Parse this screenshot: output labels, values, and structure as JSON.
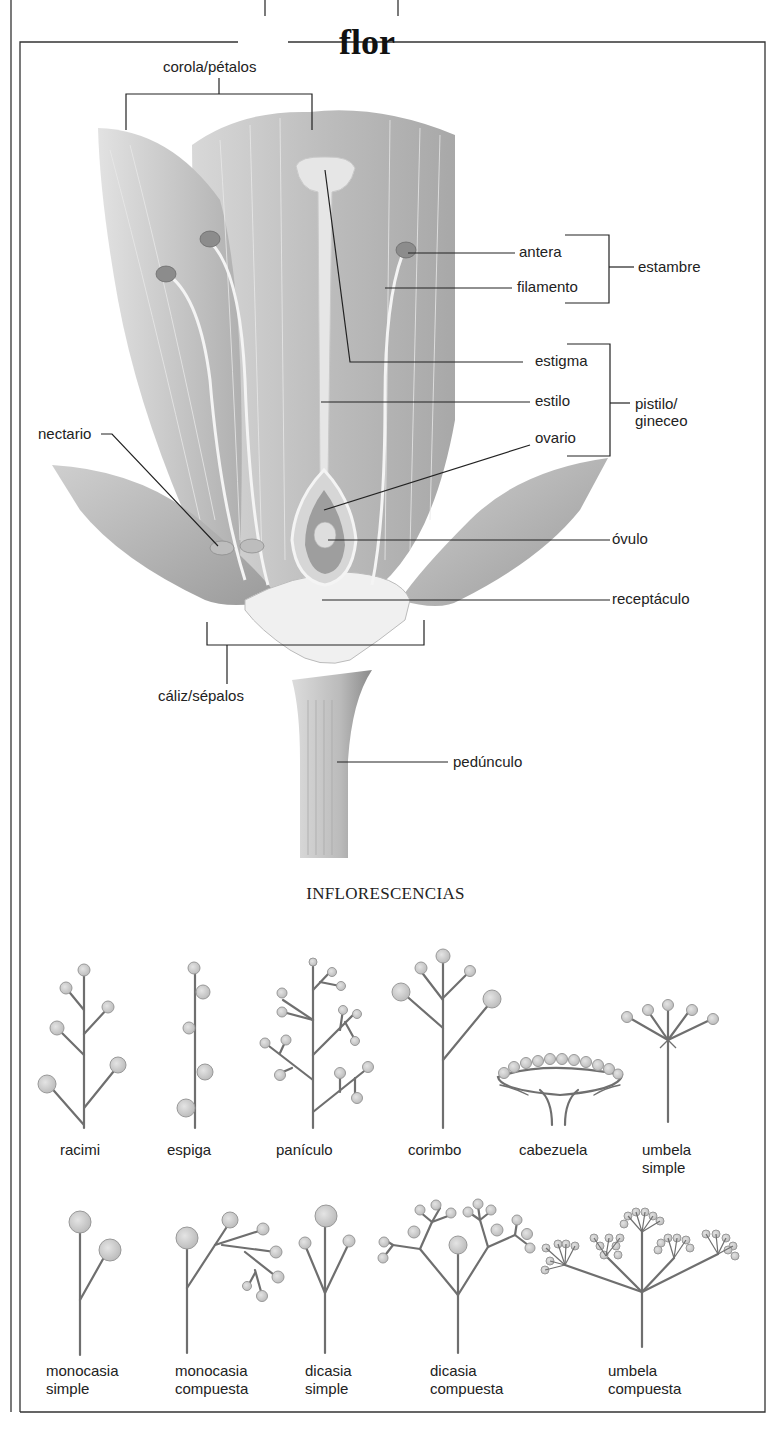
{
  "figure": {
    "title": "flor",
    "flower_labels": {
      "corola": "corola/pétalos",
      "antera": "antera",
      "filamento": "filamento",
      "estambre": "estambre",
      "estigma": "estigma",
      "estilo": "estilo",
      "ovario": "ovario",
      "pistilo_line1": "pistilo/",
      "pistilo_line2": "gineceo",
      "nectario": "nectario",
      "ovulo": "óvulo",
      "receptaculo": "receptáculo",
      "caliz": "cáliz/sépalos",
      "pedunculo": "pedúnculo"
    },
    "inflorescences": {
      "heading": "INFLORESCENCIAS",
      "row1": [
        {
          "line1": "racimi",
          "line2": ""
        },
        {
          "line1": "espiga",
          "line2": ""
        },
        {
          "line1": "panículo",
          "line2": ""
        },
        {
          "line1": "corimbo",
          "line2": ""
        },
        {
          "line1": "cabezuela",
          "line2": ""
        },
        {
          "line1": "umbela",
          "line2": "simple"
        }
      ],
      "row2": [
        {
          "line1": "monocasia",
          "line2": "simple"
        },
        {
          "line1": "monocasia",
          "line2": "compuesta"
        },
        {
          "line1": "dicasia",
          "line2": "simple"
        },
        {
          "line1": "dicasia",
          "line2": "compuesta"
        },
        {
          "line1": "umbela",
          "line2": "compuesta"
        }
      ]
    },
    "colors": {
      "ink": "#222222",
      "petal": "#c9c9c9",
      "petal_dark": "#9a9a9a",
      "floret": "#cfcfcf",
      "stem": "#777777"
    }
  }
}
